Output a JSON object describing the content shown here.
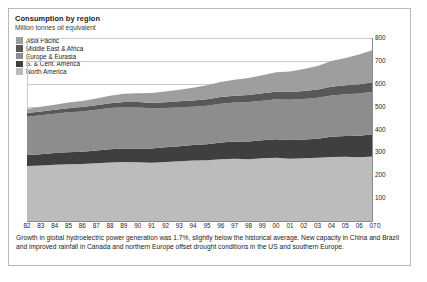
{
  "chart_title": "Consumption by region",
  "chart_subtitle": "Million tonnes oil equivalent",
  "legend": [
    {
      "label": "Asia Pacific",
      "color": "#9e9e9e"
    },
    {
      "label": "Middle East & Africa",
      "color": "#585858"
    },
    {
      "label": "Europe & Eurasia",
      "color": "#8d8d8d"
    },
    {
      "label": "S. & Cent. America",
      "color": "#3f3f3f"
    },
    {
      "label": "North America",
      "color": "#bcbcbc"
    }
  ],
  "zero_label": "0",
  "caption": "Growth in global hydroelectric power generation was 1.7%, slightly below the historical average. New capacity in China and Brazil and improved rainfall in Canada and northern Europe offset drought conditions in the US and southern Europe.",
  "chart_data": {
    "type": "area",
    "title": "Consumption by region",
    "subtitle": "Million tonnes oil equivalent",
    "xlabel": "",
    "ylabel": "Million tonnes oil equivalent",
    "ylim": [
      0,
      800
    ],
    "yticks": [
      100,
      200,
      300,
      400,
      500,
      600,
      700,
      800
    ],
    "grid": true,
    "legend_position": "top-left",
    "stacked": true,
    "stack_order_bottom_to_top": [
      "North America",
      "S. & Cent. America",
      "Europe & Eurasia",
      "Middle East & Africa",
      "Asia Pacific"
    ],
    "categories": [
      "82",
      "83",
      "84",
      "85",
      "86",
      "87",
      "88",
      "89",
      "90",
      "91",
      "92",
      "93",
      "94",
      "95",
      "96",
      "97",
      "98",
      "99",
      "00",
      "01",
      "02",
      "03",
      "04",
      "05",
      "06",
      "07"
    ],
    "x": [
      1982,
      1983,
      1984,
      1985,
      1986,
      1987,
      1988,
      1989,
      1990,
      1991,
      1992,
      1993,
      1994,
      1995,
      1996,
      1997,
      1998,
      1999,
      2000,
      2001,
      2002,
      2003,
      2004,
      2005,
      2006,
      2007
    ],
    "series": [
      {
        "name": "North America",
        "color": "#bcbcbc",
        "values": [
          240,
          243,
          246,
          248,
          249,
          252,
          256,
          258,
          257,
          255,
          258,
          261,
          264,
          266,
          270,
          272,
          270,
          274,
          276,
          272,
          274,
          276,
          280,
          281,
          279,
          282
        ]
      },
      {
        "name": "S. & Cent. America",
        "color": "#3f3f3f",
        "values": [
          48,
          49,
          51,
          53,
          54,
          56,
          58,
          59,
          60,
          62,
          64,
          66,
          68,
          70,
          73,
          76,
          78,
          79,
          81,
          82,
          82,
          84,
          88,
          91,
          94,
          97
        ]
      },
      {
        "name": "Europe & Eurasia",
        "color": "#8d8d8d",
        "values": [
          168,
          170,
          172,
          174,
          176,
          178,
          180,
          181,
          180,
          176,
          172,
          170,
          168,
          168,
          170,
          170,
          172,
          173,
          175,
          176,
          177,
          179,
          181,
          182,
          184,
          186
        ]
      },
      {
        "name": "Middle East & Africa",
        "color": "#585858",
        "values": [
          16,
          17,
          17,
          18,
          19,
          20,
          21,
          22,
          23,
          24,
          25,
          26,
          27,
          28,
          29,
          30,
          31,
          32,
          33,
          34,
          35,
          36,
          38,
          39,
          41,
          42
        ]
      },
      {
        "name": "Asia Pacific",
        "color": "#9e9e9e",
        "values": [
          18,
          20,
          22,
          25,
          27,
          30,
          33,
          36,
          39,
          43,
          47,
          51,
          56,
          61,
          66,
          70,
          74,
          79,
          85,
          90,
          96,
          103,
          112,
          120,
          130,
          140
        ]
      }
    ],
    "totals": [
      490,
      499,
      508,
      518,
      525,
      536,
      548,
      556,
      559,
      560,
      566,
      574,
      583,
      593,
      608,
      618,
      625,
      637,
      650,
      654,
      664,
      678,
      699,
      713,
      728,
      747
    ]
  }
}
